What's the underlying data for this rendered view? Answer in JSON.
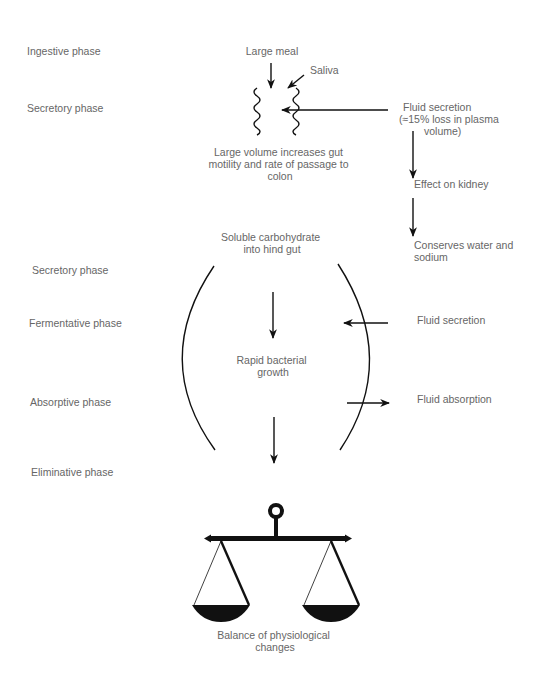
{
  "phases": [
    {
      "label": "Ingestive phase",
      "x": 27,
      "y": 54
    },
    {
      "label": "Secretory phase",
      "x": 27,
      "y": 111
    },
    {
      "label": "Secretory phase",
      "x": 32,
      "y": 273
    },
    {
      "label": "Fermentative phase",
      "x": 29,
      "y": 326
    },
    {
      "label": "Absorptive phase",
      "x": 30,
      "y": 405
    },
    {
      "label": "Eliminative phase",
      "x": 31,
      "y": 476
    }
  ],
  "nodes": {
    "large_meal": "Large meal",
    "saliva": "Saliva",
    "large_volume": [
      "Large volume increases gut",
      "motility and rate of passage to",
      "colon"
    ],
    "fluid_secretion_top": [
      "Fluid secretion",
      "(≈15% loss in plasma",
      "volume)"
    ],
    "effect_on_kidney": "Effect on kidney",
    "conserves": [
      "Conserves water and",
      "sodium"
    ],
    "soluble_carb": [
      "Soluble carbohydrate",
      "into hind gut"
    ],
    "fluid_secretion_mid": "Fluid secretion",
    "rapid_growth": [
      "Rapid bacterial",
      "growth"
    ],
    "fluid_absorption": "Fluid absorption",
    "balance": [
      "Balance of physiological",
      "changes"
    ]
  },
  "colors": {
    "text": "#666666",
    "line": "#111111",
    "background": "#ffffff"
  }
}
